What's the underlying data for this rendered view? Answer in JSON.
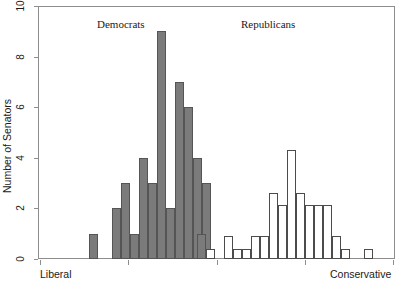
{
  "chart_data": {
    "type": "bar",
    "title": "",
    "subtitle": "",
    "xlabel": "",
    "ylabel": "Number of Senators",
    "ylim": [
      0,
      10
    ],
    "yticks": [
      0,
      2,
      4,
      6,
      8,
      10
    ],
    "ytick_labels": [
      "0",
      "2",
      "4",
      "6",
      "8",
      "10"
    ],
    "xlim": [
      0,
      1
    ],
    "grid": false,
    "legend_position": "inline-annotations",
    "axis_end_labels": {
      "left": "Liberal",
      "right": "Conservative"
    },
    "annotations": [
      {
        "text": "Democrats",
        "x_px": 97,
        "y_px": 18
      },
      {
        "text": "Republicans",
        "x_px": 241,
        "y_px": 18
      }
    ],
    "xticks_px": [
      40,
      128,
      217,
      305,
      393
    ],
    "series": [
      {
        "name": "Democrats",
        "fill": "#7b7b7b",
        "stroke": "#555555",
        "bar_width_px": 9,
        "bins": [
          {
            "x_px": 89,
            "value": 1
          },
          {
            "x_px": 112,
            "value": 2
          },
          {
            "x_px": 121,
            "value": 3
          },
          {
            "x_px": 130,
            "value": 1
          },
          {
            "x_px": 139,
            "value": 4
          },
          {
            "x_px": 148,
            "value": 3
          },
          {
            "x_px": 157,
            "value": 9
          },
          {
            "x_px": 166,
            "value": 2
          },
          {
            "x_px": 175,
            "value": 7
          },
          {
            "x_px": 184,
            "value": 6
          },
          {
            "x_px": 193,
            "value": 4
          },
          {
            "x_px": 202,
            "value": 3
          }
        ]
      },
      {
        "name": "Republicans",
        "fill": "#ffffff",
        "stroke": "#4c4c4c",
        "bar_width_px": 9,
        "bins": [
          {
            "x_px": 197,
            "value": 1,
            "fill": "#7b7b7b"
          },
          {
            "x_px": 206,
            "value": 0.4
          },
          {
            "x_px": 224,
            "value": 0.9
          },
          {
            "x_px": 233,
            "value": 0.4
          },
          {
            "x_px": 242,
            "value": 0.4
          },
          {
            "x_px": 251,
            "value": 0.9
          },
          {
            "x_px": 260,
            "value": 0.9
          },
          {
            "x_px": 269,
            "value": 2.6
          },
          {
            "x_px": 278,
            "value": 2.15
          },
          {
            "x_px": 287,
            "value": 4.3
          },
          {
            "x_px": 296,
            "value": 2.6
          },
          {
            "x_px": 305,
            "value": 2.15
          },
          {
            "x_px": 314,
            "value": 2.15
          },
          {
            "x_px": 323,
            "value": 2.15
          },
          {
            "x_px": 332,
            "value": 0.9
          },
          {
            "x_px": 341,
            "value": 0.4
          },
          {
            "x_px": 364,
            "value": 0.4
          }
        ]
      }
    ]
  },
  "figure": {
    "plot_left_px": 38,
    "plot_top_px": 6,
    "plot_right_px": 395,
    "plot_bottom_px": 259
  }
}
